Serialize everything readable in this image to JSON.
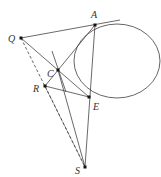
{
  "diagram": {
    "points": [
      {
        "id": "A",
        "label": "A"
      },
      {
        "id": "Q",
        "label": "Q"
      },
      {
        "id": "C",
        "label": "C"
      },
      {
        "id": "R",
        "label": "R"
      },
      {
        "id": "E",
        "label": "E"
      },
      {
        "id": "S",
        "label": "S"
      }
    ],
    "segments": [
      {
        "from": "Q",
        "to": "A",
        "style": "solid",
        "extended": true
      },
      {
        "from": "Q",
        "to": "E",
        "style": "solid",
        "through": "C"
      },
      {
        "from": "A",
        "to": "R",
        "style": "solid",
        "through": "C"
      },
      {
        "from": "R",
        "to": "E",
        "style": "solid"
      },
      {
        "from": "A",
        "to": "S",
        "style": "solid",
        "through": "E"
      },
      {
        "from": "C",
        "to": "S",
        "style": "solid"
      },
      {
        "from": "Q",
        "to": "S",
        "style": "dashed"
      },
      {
        "from": "R",
        "to": "S",
        "style": "dashed"
      }
    ],
    "tangent_at": "C",
    "circle_through": [
      "A",
      "C",
      "E"
    ],
    "colors": {
      "stroke": "#444444",
      "point": "#111111",
      "label": "#333333"
    }
  }
}
